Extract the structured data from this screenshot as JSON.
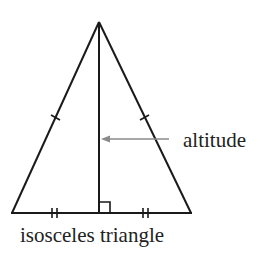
{
  "diagram": {
    "title": "isosceles triangle",
    "labels": {
      "altitude": "altitude",
      "caption": "isosceles triangle"
    },
    "colors": {
      "stroke": "#1a1a1a",
      "arrow": "#8a8a8a",
      "text": "#222222",
      "background": "#ffffff"
    },
    "geometry": {
      "apex": [
        99,
        22
      ],
      "base_left": [
        12,
        213
      ],
      "base_right": [
        191,
        213
      ],
      "altitude_foot": [
        99,
        213
      ],
      "right_angle_box": {
        "x": 99,
        "y": 202,
        "size": 11
      },
      "congruent_legs_marks": "single tick",
      "congruent_base_halves_marks": "double tick",
      "arrow": {
        "from": [
          168,
          139
        ],
        "to": [
          101,
          139
        ]
      }
    }
  }
}
